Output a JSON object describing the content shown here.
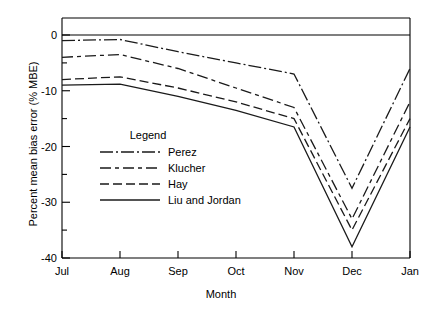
{
  "chart_data": {
    "type": "line",
    "title": "",
    "xlabel": "Month",
    "ylabel": "Percent mean bias error (% MBE)",
    "categories": [
      "Jul",
      "Aug",
      "Sep",
      "Oct",
      "Nov",
      "Dec",
      "Jan"
    ],
    "x_tick_labels": [
      "Jul",
      "Aug",
      "Sep",
      "Oct",
      "Nov",
      "Dec",
      "Jan"
    ],
    "y_tick_labels": [
      "0",
      "-10",
      "-20",
      "-30",
      "-40"
    ],
    "y_major_ticks": [
      0,
      -10,
      -20,
      -30,
      -40
    ],
    "y_minor_ticks": [
      -5,
      -15,
      -25,
      -35
    ],
    "ylim": [
      -40,
      2
    ],
    "xlim": [
      0,
      6
    ],
    "grid": false,
    "legend_position": "center-left inside plot",
    "legend_title": "Legend",
    "series": [
      {
        "name": "Perez",
        "dash": "dash-dot",
        "values": [
          -1.0,
          -0.8,
          -3.0,
          -5.0,
          -7.0,
          -27.5,
          -6.0
        ]
      },
      {
        "name": "Klucher",
        "dash": "long-dash-dot",
        "values": [
          -4.0,
          -3.5,
          -6.0,
          -9.5,
          -13.0,
          -33.0,
          -12.0
        ]
      },
      {
        "name": "Hay",
        "dash": "dashed",
        "values": [
          -8.0,
          -7.5,
          -9.5,
          -12.0,
          -15.0,
          -35.0,
          -15.0
        ]
      },
      {
        "name": "Liu and Jordan",
        "dash": "solid",
        "values": [
          -9.0,
          -8.8,
          -11.0,
          -13.5,
          -16.5,
          -38.0,
          -16.5
        ]
      }
    ]
  },
  "axes": {
    "y_title": "Percent mean bias error (% MBE)",
    "x_title": "Month"
  },
  "legend": {
    "title": "Legend",
    "entries": [
      {
        "label": "Perez"
      },
      {
        "label": "Klucher"
      },
      {
        "label": "Hay"
      },
      {
        "label": "Liu and Jordan"
      }
    ]
  },
  "style": {
    "line_color": "#1a1a1a",
    "axis_color": "#000000",
    "background": "#ffffff"
  }
}
